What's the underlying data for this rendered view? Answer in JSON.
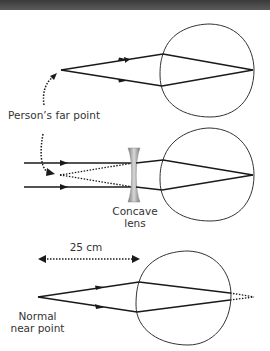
{
  "labels": {
    "far_point": "Person’s far point",
    "concave_lens_line1": "Concave",
    "concave_lens_line2": "lens",
    "distance": "25 cm",
    "near_point_line1": "Normal",
    "near_point_line2": "near point"
  },
  "panels": [
    {
      "name": "myopic-eye-far-point",
      "description": "rays from far point focus on retina"
    },
    {
      "name": "myopic-eye-corrected",
      "description": "parallel rays diverged by concave lens appear from far point"
    },
    {
      "name": "normal-near-point",
      "description": "rays from 25 cm near point focus behind retina"
    }
  ],
  "colors": {
    "ray": "#1a1a1a",
    "eye_outline": "#333333",
    "text": "#333333",
    "lens": "#9a9a9a",
    "topbar": "#444444"
  }
}
